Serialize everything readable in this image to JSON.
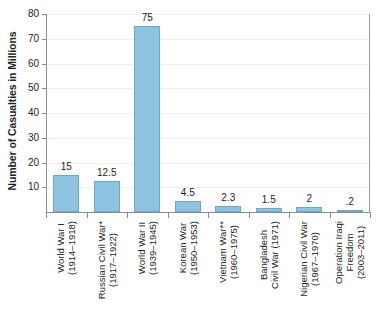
{
  "chart_data": {
    "type": "bar",
    "title": "",
    "xlabel": "",
    "ylabel": "Number of Casualties in Millions",
    "ylim": [
      0,
      80
    ],
    "grid": true,
    "legend": "none",
    "ytick_labels": [
      "80",
      "70",
      "60",
      "50",
      "40",
      "30",
      "20",
      "10"
    ],
    "ytick_values": [
      80,
      70,
      60,
      50,
      40,
      30,
      20,
      10
    ],
    "categories": [
      "World War I (1914–1918)",
      "Russian Civil War* (1917–1922)",
      "World War II (1939–1945)",
      "Korean War (1950–1953)",
      "Vietnam War** (1960–1975)",
      "Bangladesh Civil War (1971)",
      "Nigerian Civil War (1967–1970)",
      "Operation Iraqi Freedom (2003–2011)"
    ],
    "category_lines": [
      [
        "World War I",
        "(1914–1918)"
      ],
      [
        "Russian Civil War*",
        "(1917–1922)"
      ],
      [
        "World War II",
        "(1939–1945)"
      ],
      [
        "Korean War",
        "(1950–1953)"
      ],
      [
        "Vietnam War**",
        "(1960–1975)"
      ],
      [
        "Bangladesh",
        "Civil War (1971)"
      ],
      [
        "Nigerian Civil War",
        "(1967–1970)"
      ],
      [
        "Operation Iraqi",
        "Freedom",
        "(2003–2011)"
      ]
    ],
    "values": [
      15,
      12.5,
      75,
      4.5,
      2.3,
      1.5,
      2,
      0.2
    ],
    "value_labels": [
      "15",
      "12.5",
      "75",
      "4.5",
      "2.3",
      "1.5",
      "2",
      ".2"
    ],
    "colors": {
      "bar_fill": "#8ec4e2",
      "bar_edge": "#6aa8cc",
      "axis": "#8d8d8d",
      "gridline": "#f0f0f0",
      "text": "#231f20",
      "background": "#ffffff"
    }
  }
}
